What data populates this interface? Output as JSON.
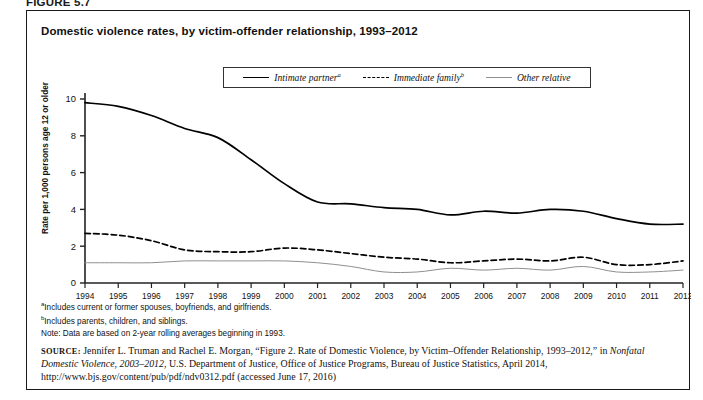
{
  "figure_label": "FIGURE 5.7",
  "chart": {
    "title": "Domestic violence rates, by victim-offender relationship, 1993–2012",
    "ylabel": "Rate per 1,000 persons age 12 or older",
    "legend": [
      {
        "label": "Intimate partner",
        "marker": "a",
        "style": "solid",
        "color": "#000000"
      },
      {
        "label": "Immediate family",
        "marker": "b",
        "style": "dashed",
        "color": "#000000"
      },
      {
        "label": "Other relative",
        "marker": "",
        "style": "thin-solid",
        "color": "#8f8f8f"
      }
    ]
  },
  "footnotes": [
    {
      "marker": "a",
      "text": "Includes current or former spouses, boyfriends, and girlfriends."
    },
    {
      "marker": "b",
      "text": "Includes parents, children, and siblings."
    },
    {
      "marker": "",
      "text": "Note: Data are based on 2-year rolling averages beginning in 1993."
    }
  ],
  "source": {
    "prefix": "SOURCE:",
    "line1_a": " Jennifer L. Truman and Rachel E. Morgan, “Figure 2. Rate of Domestic Violence, by Victim–Offender Relationship, 1993–2012,” in ",
    "italic1": "Nonfatal Domestic Violence, 2003–2012",
    "line1_b": ", U.S. Department of Justice, Office of Justice Programs, Bureau of Justice Statistics, April 2014, http://www.bjs.gov/content/pub/pdf/ndv0312.pdf (accessed June 17, 2016)"
  },
  "chart_data": {
    "type": "line",
    "title": "Domestic violence rates, by victim-offender relationship, 1993–2012",
    "xlabel": "",
    "ylabel": "Rate per 1,000 persons age 12 or older",
    "xlim": [
      1994,
      2012
    ],
    "ylim": [
      0,
      10
    ],
    "yticks": [
      0,
      2,
      4,
      6,
      8,
      10
    ],
    "grid": false,
    "legend_position": "top-center",
    "x": [
      1994,
      1995,
      1996,
      1997,
      1998,
      1999,
      2000,
      2001,
      2002,
      2003,
      2004,
      2005,
      2006,
      2007,
      2008,
      2009,
      2010,
      2011,
      2012
    ],
    "series": [
      {
        "name": "Intimate partner",
        "style": "solid",
        "color": "#000000",
        "values": [
          9.8,
          9.6,
          9.1,
          8.4,
          7.9,
          6.7,
          5.4,
          4.4,
          4.3,
          4.1,
          4.0,
          3.7,
          3.9,
          3.8,
          4.0,
          3.9,
          3.5,
          3.2,
          3.2
        ]
      },
      {
        "name": "Immediate family",
        "style": "dashed",
        "color": "#000000",
        "values": [
          2.7,
          2.6,
          2.3,
          1.8,
          1.7,
          1.7,
          1.9,
          1.8,
          1.6,
          1.4,
          1.3,
          1.1,
          1.2,
          1.3,
          1.2,
          1.4,
          1.0,
          1.0,
          1.2
        ]
      },
      {
        "name": "Other relative",
        "style": "thin-solid",
        "color": "#8f8f8f",
        "values": [
          1.1,
          1.1,
          1.1,
          1.2,
          1.2,
          1.2,
          1.2,
          1.1,
          0.9,
          0.6,
          0.6,
          0.8,
          0.7,
          0.8,
          0.7,
          0.9,
          0.6,
          0.6,
          0.7
        ]
      }
    ]
  }
}
